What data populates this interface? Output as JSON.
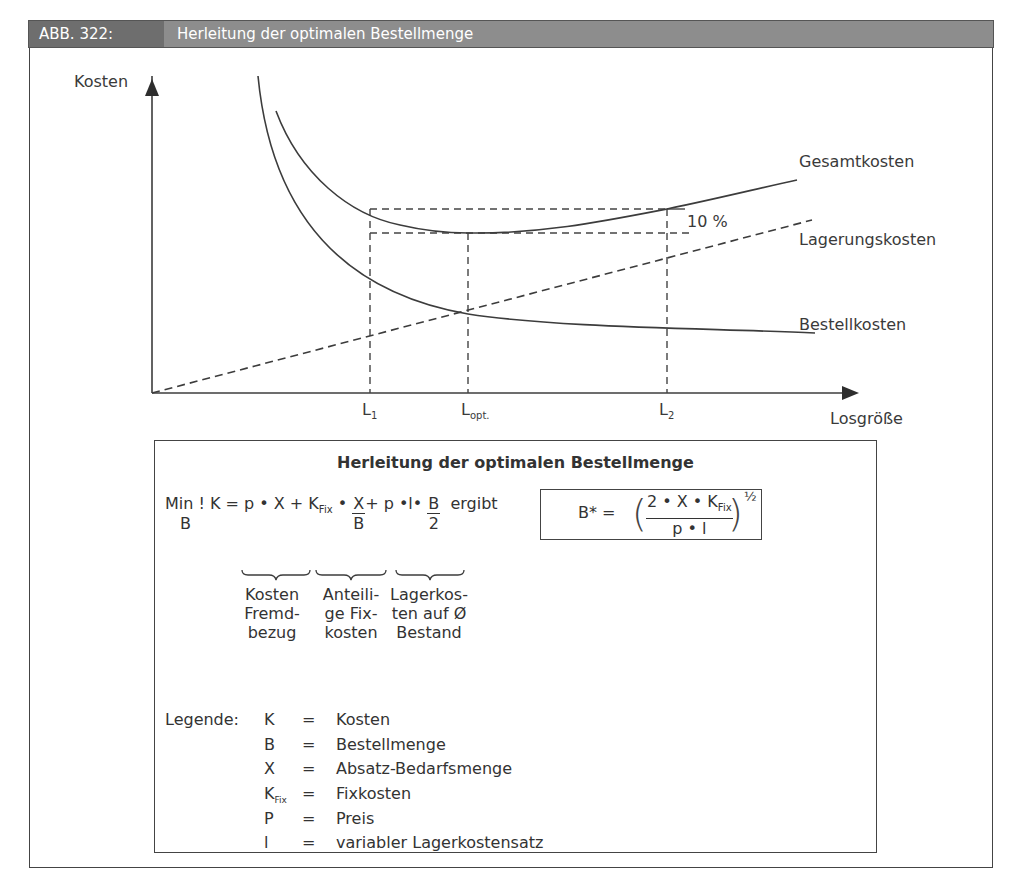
{
  "header": {
    "figure_number": "ABB. 322:",
    "title": "Herleitung der optimalen Bestellmenge"
  },
  "chart": {
    "y_axis_label": "Kosten",
    "x_axis_label": "Losgröße",
    "x_ticks": [
      {
        "base": "L",
        "sub": "1"
      },
      {
        "base": "L",
        "sub": "opt."
      },
      {
        "base": "L",
        "sub": "2"
      }
    ],
    "curves": {
      "total": "Gesamtkosten",
      "storage": "Lagerungskosten",
      "order": "Bestellkosten"
    },
    "annotation": "10 %"
  },
  "chart_data": {
    "type": "line",
    "title": "Herleitung der optimalen Bestellmenge",
    "xlabel": "Losgröße",
    "ylabel": "Kosten",
    "x_ticks": [
      "L1",
      "Lopt.",
      "L2"
    ],
    "grid": false,
    "series": [
      {
        "name": "Gesamtkosten",
        "style": "solid",
        "shape": "U-shaped, minimum at Lopt."
      },
      {
        "name": "Lagerungskosten",
        "style": "dashed",
        "shape": "linear increasing from origin"
      },
      {
        "name": "Bestellkosten",
        "style": "solid",
        "shape": "hyperbolic decreasing"
      }
    ],
    "annotations": [
      {
        "text": "10 %",
        "meaning": "Gesamtkosten at L1 and L2 are 10 % above the minimum at Lopt."
      }
    ]
  },
  "formula_box": {
    "title": "Herleitung der optimalen Bestellmenge",
    "objective": {
      "min": "Min !",
      "min_sub": "B",
      "lhs": "K = p • X + K",
      "kfix_sub": "Fix",
      "mid": " • ",
      "frac1_num": "X",
      "frac1_den": "B",
      "plus2": "+ p •l• ",
      "frac2_num": "B",
      "frac2_den": "2",
      "result_word": "ergibt"
    },
    "result": {
      "lhs": "B* = ",
      "num": "2 • X • K",
      "num_sub": "Fix",
      "den": "p  • l",
      "exponent": "½"
    },
    "brace_labels": [
      "Kosten\nFremd-\nbezug",
      "Anteili-\nge Fix-\nkosten",
      "Lagerkos-\nten auf Ø\nBestand"
    ],
    "legend": {
      "label": "Legende:",
      "items": [
        {
          "symbol": "K",
          "sub": "",
          "eq": "=",
          "meaning": "Kosten"
        },
        {
          "symbol": "B",
          "sub": "",
          "eq": "=",
          "meaning": "Bestellmenge"
        },
        {
          "symbol": "X",
          "sub": "",
          "eq": "=",
          "meaning": "Absatz-Bedarfsmenge"
        },
        {
          "symbol": "K",
          "sub": "Fix",
          "eq": "=",
          "meaning": "Fixkosten"
        },
        {
          "symbol": "P",
          "sub": "",
          "eq": "=",
          "meaning": "Preis"
        },
        {
          "symbol": "l",
          "sub": "",
          "eq": "=",
          "meaning": "variabler Lagerkostensatz"
        }
      ]
    }
  },
  "colors": {
    "header_dark": "#6e6e6e",
    "header_light": "#8d8d8d",
    "line": "#3c3c3c"
  }
}
